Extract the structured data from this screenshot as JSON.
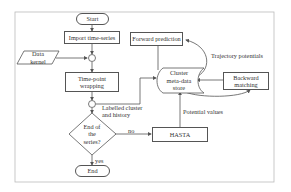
{
  "diagram": {
    "frame_color": "#bbbbbb",
    "line_color": "#555555",
    "nodes": {
      "start": "Start",
      "import": "Import time-series",
      "data_kernel": "Data\nkernel",
      "time_point_wrapping": "Time-point\nwrapping",
      "decision": "End of\nthe\nseries?",
      "end": "End",
      "forward_prediction": "Forward prediction",
      "cluster_store": "Cluster\nmeta-data\nstore",
      "backward_matching": "Backward\nmatching",
      "hasta": "HASTA"
    },
    "edge_labels": {
      "labelled_cluster": "Labelled cluster\nand history",
      "no": "no",
      "yes": "yes",
      "trajectory_potentials": "Trajectory potentials",
      "potential_values": "Potential values"
    }
  }
}
